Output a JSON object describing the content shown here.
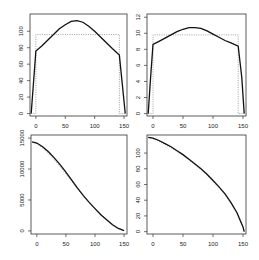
{
  "chart_data": [
    {
      "type": "line",
      "panel": "top-left",
      "title": "",
      "xlabel": "",
      "ylabel": "",
      "xlim": [
        -10,
        155
      ],
      "ylim": [
        -3,
        121
      ],
      "xticks": [
        0,
        50,
        100,
        150
      ],
      "yticks": [
        0,
        20,
        40,
        60,
        80,
        100
      ],
      "grid": false,
      "series": [
        {
          "name": "solid",
          "style": "solid",
          "x": [
            -8,
            0,
            10,
            20,
            30,
            40,
            50,
            60,
            70,
            80,
            90,
            100,
            110,
            120,
            130,
            142,
            152
          ],
          "y": [
            0,
            76,
            82,
            89,
            96,
            103,
            108,
            112,
            113,
            111,
            106,
            100,
            93,
            86,
            79,
            71,
            0
          ]
        },
        {
          "name": "dotted",
          "style": "dotted",
          "x": [
            -8,
            0,
            0,
            142,
            142,
            152
          ],
          "y": [
            0,
            0,
            96,
            96,
            0,
            0
          ]
        }
      ]
    },
    {
      "type": "line",
      "panel": "top-right",
      "title": "",
      "xlabel": "",
      "ylabel": "",
      "xlim": [
        -10,
        155
      ],
      "ylim": [
        -0.3,
        12.4
      ],
      "xticks": [
        0,
        50,
        100,
        150
      ],
      "yticks": [
        0,
        2,
        4,
        6,
        8,
        10,
        12
      ],
      "grid": false,
      "series": [
        {
          "name": "solid",
          "style": "solid",
          "x": [
            -8,
            -4,
            0,
            10,
            20,
            30,
            40,
            50,
            60,
            70,
            80,
            90,
            100,
            110,
            120,
            130,
            142,
            148,
            152
          ],
          "y": [
            0,
            4.5,
            8.6,
            9.0,
            9.4,
            9.8,
            10.2,
            10.5,
            10.7,
            10.7,
            10.6,
            10.3,
            9.9,
            9.5,
            9.1,
            8.8,
            8.4,
            4.5,
            0
          ]
        },
        {
          "name": "dotted",
          "style": "dotted",
          "x": [
            -8,
            0,
            0,
            142,
            142,
            152
          ],
          "y": [
            0,
            0,
            9.8,
            9.8,
            0,
            0
          ]
        }
      ]
    },
    {
      "type": "line",
      "panel": "bottom-left",
      "title": "",
      "xlabel": "",
      "ylabel": "",
      "xlim": [
        -10,
        155
      ],
      "ylim": [
        -500,
        15500
      ],
      "xticks": [
        0,
        50,
        100,
        150
      ],
      "yticks": [
        0,
        5000,
        10000,
        15000
      ],
      "grid": false,
      "series": [
        {
          "name": "solid",
          "style": "solid",
          "x": [
            -8,
            0,
            10,
            20,
            30,
            40,
            50,
            60,
            70,
            80,
            90,
            100,
            110,
            120,
            130,
            140,
            150
          ],
          "y": [
            14400,
            14200,
            13600,
            12800,
            11800,
            10700,
            9500,
            8200,
            6900,
            5700,
            4600,
            3600,
            2600,
            1800,
            1000,
            400,
            50
          ]
        },
        {
          "name": "dotted",
          "style": "dotted",
          "x": [
            -8,
            0,
            10,
            20,
            30,
            40,
            50,
            60,
            70,
            80,
            90,
            100,
            110,
            120,
            130,
            140,
            150
          ],
          "y": [
            14400,
            14100,
            13400,
            12500,
            11500,
            10400,
            9200,
            8000,
            6800,
            5700,
            4600,
            3600,
            2700,
            1800,
            1100,
            500,
            50
          ]
        }
      ]
    },
    {
      "type": "line",
      "panel": "bottom-right",
      "title": "",
      "xlabel": "",
      "ylabel": "",
      "xlim": [
        -10,
        155
      ],
      "ylim": [
        -3,
        123
      ],
      "xticks": [
        0,
        50,
        100,
        150
      ],
      "yticks": [
        0,
        20,
        40,
        60,
        80,
        100
      ],
      "grid": false,
      "series": [
        {
          "name": "solid",
          "style": "solid",
          "x": [
            -8,
            0,
            10,
            20,
            30,
            40,
            50,
            60,
            70,
            80,
            90,
            100,
            110,
            120,
            130,
            140,
            150,
            152
          ],
          "y": [
            120,
            119,
            116,
            112,
            108,
            103,
            98,
            92,
            86,
            80,
            73,
            65,
            57,
            48,
            37,
            24,
            6,
            0
          ]
        },
        {
          "name": "dotted",
          "style": "dotted",
          "x": [
            -8,
            0,
            10,
            20,
            30,
            40,
            50,
            60,
            70,
            80,
            90,
            100,
            110,
            120,
            130,
            140,
            150,
            152
          ],
          "y": [
            120,
            118,
            115,
            111,
            107,
            102,
            97,
            91,
            85,
            79,
            72,
            64,
            56,
            47,
            36,
            23,
            5,
            0
          ]
        }
      ]
    }
  ],
  "panels": [
    {
      "box": [
        30,
        14,
        127,
        116
      ],
      "ytick_labels": [
        "0",
        "20",
        "40",
        "60",
        "80",
        "100"
      ],
      "xtick_labels": [
        "0",
        "50",
        "100",
        "150"
      ]
    },
    {
      "box": [
        147,
        14,
        246,
        116
      ],
      "ytick_labels": [
        "0",
        "2",
        "4",
        "6",
        "8",
        "10",
        "12"
      ],
      "xtick_labels": [
        "0",
        "50",
        "100",
        "150"
      ]
    },
    {
      "box": [
        31,
        135,
        127,
        234
      ],
      "ytick_labels": [
        "0",
        "5000",
        "10000",
        "15000"
      ],
      "xtick_labels": [
        "0",
        "50",
        "100",
        "150"
      ]
    },
    {
      "box": [
        147,
        135,
        246,
        234
      ],
      "ytick_labels": [
        "0",
        "20",
        "40",
        "60",
        "80",
        "100"
      ],
      "xtick_labels": [
        "0",
        "50",
        "100",
        "150"
      ]
    }
  ]
}
